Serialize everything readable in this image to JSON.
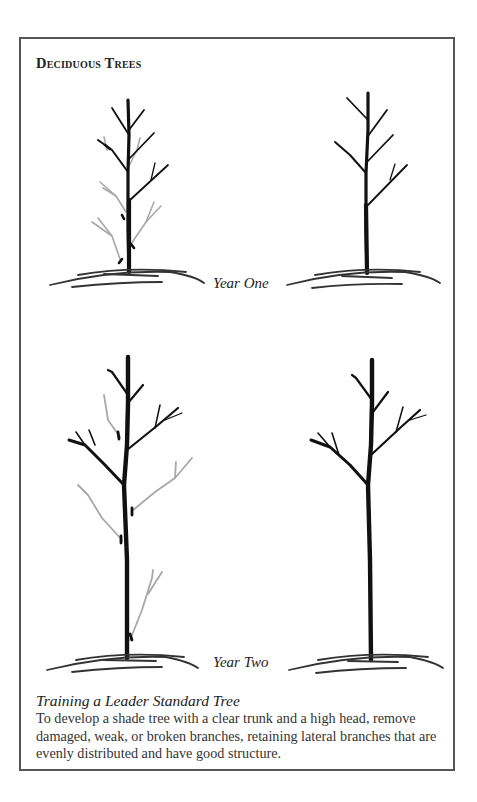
{
  "figure": {
    "title": "Deciduous Trees",
    "rows": [
      {
        "label": "Year One",
        "panels": [
          {
            "state": "before-pruning",
            "note": "gray branches with cut marks indicate removal"
          },
          {
            "state": "after-pruning"
          }
        ]
      },
      {
        "label": "Year Two",
        "panels": [
          {
            "state": "before-pruning",
            "note": "gray branches with cut marks indicate removal"
          },
          {
            "state": "after-pruning"
          }
        ]
      }
    ],
    "colors": {
      "retained_branch": "#111111",
      "removed_branch": "#a8a8a8",
      "cut_mark": "#111111",
      "ground": "#333333",
      "frame": "#555555"
    }
  },
  "caption": {
    "title": "Training a Leader Standard Tree",
    "body": "To develop a shade tree with a clear trunk and a high head, remove damaged, weak, or broken branches, retaining lateral branches that are evenly distributed and have good structure."
  }
}
